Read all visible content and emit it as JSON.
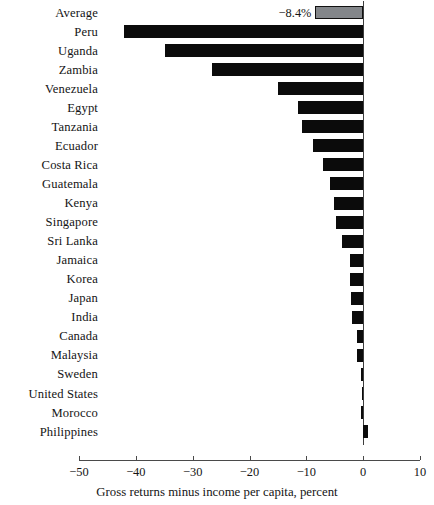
{
  "chart_data": {
    "type": "bar",
    "orientation": "horizontal",
    "title": "",
    "subtitle": "",
    "xlabel": "Gross returns minus income per capita, percent",
    "ylabel": "",
    "xlim": [
      -50,
      10
    ],
    "ylim": [],
    "grid": false,
    "legend": null,
    "xticks": [
      -50,
      -40,
      -30,
      -20,
      -10,
      0,
      10
    ],
    "xtick_labels": [
      "−50",
      "−40",
      "−30",
      "−20",
      "−10",
      "0",
      "10"
    ],
    "categories": [
      "Average",
      "Peru",
      "Uganda",
      "Zambia",
      "Venezuela",
      "Egypt",
      "Tanzania",
      "Ecuador",
      "Costa Rica",
      "Guatemala",
      "Kenya",
      "Singapore",
      "Sri Lanka",
      "Jamaica",
      "Korea",
      "Japan",
      "India",
      "Canada",
      "Malaysia",
      "Sweden",
      "United States",
      "Morocco",
      "Philippines"
    ],
    "values": [
      -8.4,
      -42.0,
      -34.8,
      -26.6,
      -15.0,
      -11.4,
      -10.7,
      -8.8,
      -7.1,
      -5.9,
      -5.2,
      -4.8,
      -3.8,
      -2.4,
      -2.3,
      -2.2,
      -1.9,
      -1.1,
      -1.0,
      -0.4,
      -0.2,
      -0.3,
      0.9
    ],
    "annotations": [
      {
        "category": "Average",
        "text": "−8.4%",
        "position": "left-of-bar"
      }
    ],
    "series_colors": {
      "bar": "#0b0b0b",
      "average_bar_fill": "#83868a",
      "average_bar_edge": "#111111"
    },
    "axis_color": "#4a4a4a",
    "background": "#ffffff"
  }
}
